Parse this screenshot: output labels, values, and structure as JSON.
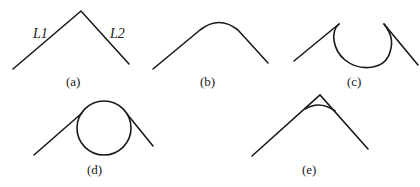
{
  "figure": {
    "panels": [
      {
        "id": "a",
        "caption": "(a)",
        "description": "Two straight lines meeting at a sharp corner",
        "line_labels": [
          "L1",
          "L2"
        ]
      },
      {
        "id": "b",
        "caption": "(b)",
        "description": "Corner replaced by a rounded arc (fillet)"
      },
      {
        "id": "c",
        "caption": "(c)",
        "description": "Lines joined by a large downward loop arc"
      },
      {
        "id": "d",
        "caption": "(d)",
        "description": "Full circle tangent to both lines at the corner"
      },
      {
        "id": "e",
        "caption": "(e)",
        "description": "Sharp corner with a small arc cutting across near the apex"
      }
    ]
  },
  "colors": {
    "stroke": "#1a1a1a",
    "background": "#ffffff"
  }
}
